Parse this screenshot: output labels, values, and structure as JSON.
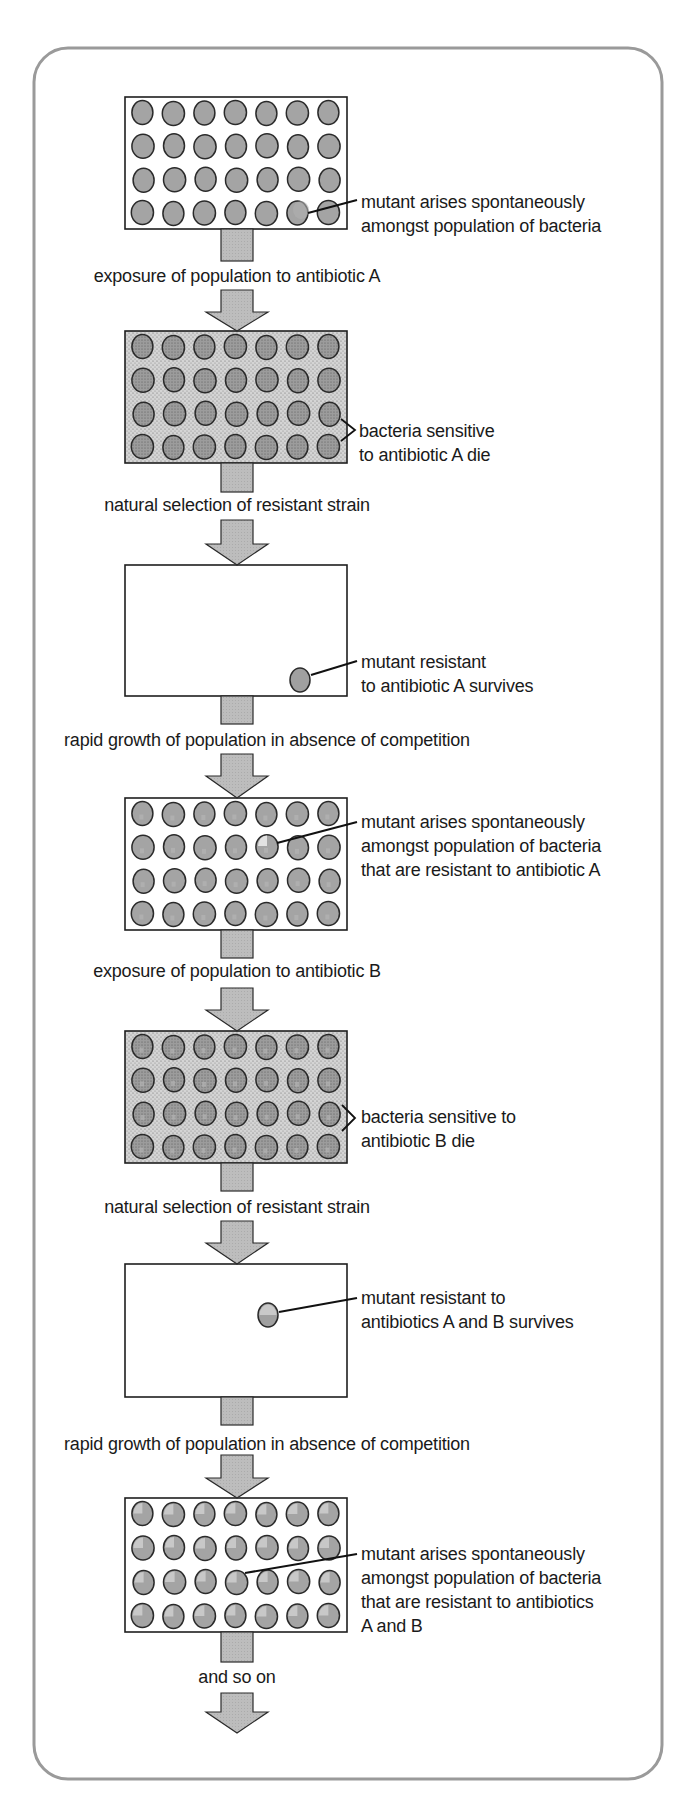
{
  "diagram": {
    "colors": {
      "frame": "#9a9a9a",
      "bacterium_fill": "#a4a4a4",
      "bacterium_outline": "#2a2a2a",
      "arrow_fill": "#b8b8b8",
      "stipple_bg": "#cfcfcf",
      "text": "#1a1a1a"
    },
    "stages": [
      {
        "id": "stage-1",
        "type": "full-population",
        "grid": {
          "rows": 4,
          "cols": 7
        },
        "annotation": [
          "mutant arises spontaneously",
          "amongst population of bacteria"
        ]
      },
      {
        "id": "stage-2",
        "type": "exposed-population",
        "grid": {
          "rows": 4,
          "cols": 7
        },
        "annotation": [
          "bacteria sensitive",
          "to antibiotic A die"
        ]
      },
      {
        "id": "stage-3",
        "type": "single-survivor",
        "annotation": [
          "mutant resistant",
          "to antibiotic A survives"
        ]
      },
      {
        "id": "stage-4",
        "type": "full-population",
        "grid": {
          "rows": 4,
          "cols": 7
        },
        "annotation": [
          "mutant arises spontaneously",
          "amongst population of bacteria",
          "that are resistant to antibiotic A"
        ]
      },
      {
        "id": "stage-5",
        "type": "exposed-population",
        "grid": {
          "rows": 4,
          "cols": 7
        },
        "annotation": [
          "bacteria sensitive to",
          "antibiotic B die"
        ]
      },
      {
        "id": "stage-6",
        "type": "single-survivor",
        "annotation": [
          "mutant resistant to",
          "antibiotics A and B survives"
        ]
      },
      {
        "id": "stage-7",
        "type": "full-population",
        "grid": {
          "rows": 4,
          "cols": 7
        },
        "annotation": [
          "mutant arises spontaneously",
          "amongst population of bacteria",
          "that are resistant to antibiotics",
          "A and B"
        ]
      }
    ],
    "transitions": [
      "exposure of population to antibiotic A",
      "natural selection of resistant strain",
      "rapid growth of population in absence of competition",
      "exposure of population to antibiotic B",
      "natural selection of resistant strain",
      "rapid growth of population in absence of competition",
      "and so on"
    ]
  }
}
